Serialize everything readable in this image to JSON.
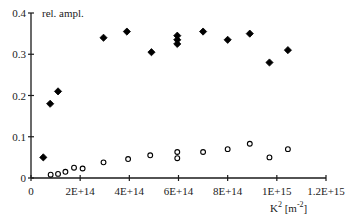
{
  "chart_data": {
    "type": "scatter",
    "title": "",
    "ylabel": "rel. ampl.",
    "xlabel": "K^2 [m^-2]",
    "xlabel_main": "K",
    "xlabel_sup": "2",
    "xlabel_unit_pre": " [m",
    "xlabel_unit_sup": "-2",
    "xlabel_unit_post": "]",
    "xlim": [
      0,
      1200000000000000.0
    ],
    "ylim": [
      0,
      0.4
    ],
    "grid": false,
    "legend": null,
    "x_ticks": [
      0,
      200000000000000.0,
      400000000000000.0,
      600000000000000.0,
      800000000000000.0,
      1000000000000000.0,
      1200000000000000.0
    ],
    "x_tick_labels": [
      "0",
      "2E+14",
      "4E+14",
      "6E+14",
      "8E+14",
      "1E+15",
      "1.2E+15"
    ],
    "y_ticks": [
      0,
      0.1,
      0.2,
      0.3,
      0.4
    ],
    "y_tick_labels": [
      "0",
      "0.1",
      "0.2",
      "0.3",
      "0.4"
    ],
    "series": [
      {
        "name": "filled diamonds",
        "marker": "filled-diamond",
        "points": [
          {
            "x": 50000000000000.0,
            "y": 0.05
          },
          {
            "x": 78000000000000.0,
            "y": 0.18
          },
          {
            "x": 110000000000000.0,
            "y": 0.21
          },
          {
            "x": 295000000000000.0,
            "y": 0.34
          },
          {
            "x": 390000000000000.0,
            "y": 0.355
          },
          {
            "x": 490000000000000.0,
            "y": 0.305
          },
          {
            "x": 595000000000000.0,
            "y": 0.345
          },
          {
            "x": 595000000000000.0,
            "y": 0.335
          },
          {
            "x": 595000000000000.0,
            "y": 0.325
          },
          {
            "x": 700000000000000.0,
            "y": 0.355
          },
          {
            "x": 800000000000000.0,
            "y": 0.335
          },
          {
            "x": 890000000000000.0,
            "y": 0.35
          },
          {
            "x": 970000000000000.0,
            "y": 0.28
          },
          {
            "x": 1045000000000000.0,
            "y": 0.31
          }
        ]
      },
      {
        "name": "open circles",
        "marker": "open-circle",
        "points": [
          {
            "x": 80000000000000.0,
            "y": 0.008
          },
          {
            "x": 110000000000000.0,
            "y": 0.01
          },
          {
            "x": 140000000000000.0,
            "y": 0.015
          },
          {
            "x": 175000000000000.0,
            "y": 0.025
          },
          {
            "x": 210000000000000.0,
            "y": 0.023
          },
          {
            "x": 295000000000000.0,
            "y": 0.038
          },
          {
            "x": 395000000000000.0,
            "y": 0.046
          },
          {
            "x": 485000000000000.0,
            "y": 0.055
          },
          {
            "x": 595000000000000.0,
            "y": 0.063
          },
          {
            "x": 595000000000000.0,
            "y": 0.048
          },
          {
            "x": 700000000000000.0,
            "y": 0.063
          },
          {
            "x": 800000000000000.0,
            "y": 0.07
          },
          {
            "x": 890000000000000.0,
            "y": 0.083
          },
          {
            "x": 970000000000000.0,
            "y": 0.05
          },
          {
            "x": 1045000000000000.0,
            "y": 0.07
          }
        ]
      }
    ]
  },
  "colors": {
    "axis": "#1a1a1a",
    "marker": "#000000",
    "background": "#ffffff"
  }
}
